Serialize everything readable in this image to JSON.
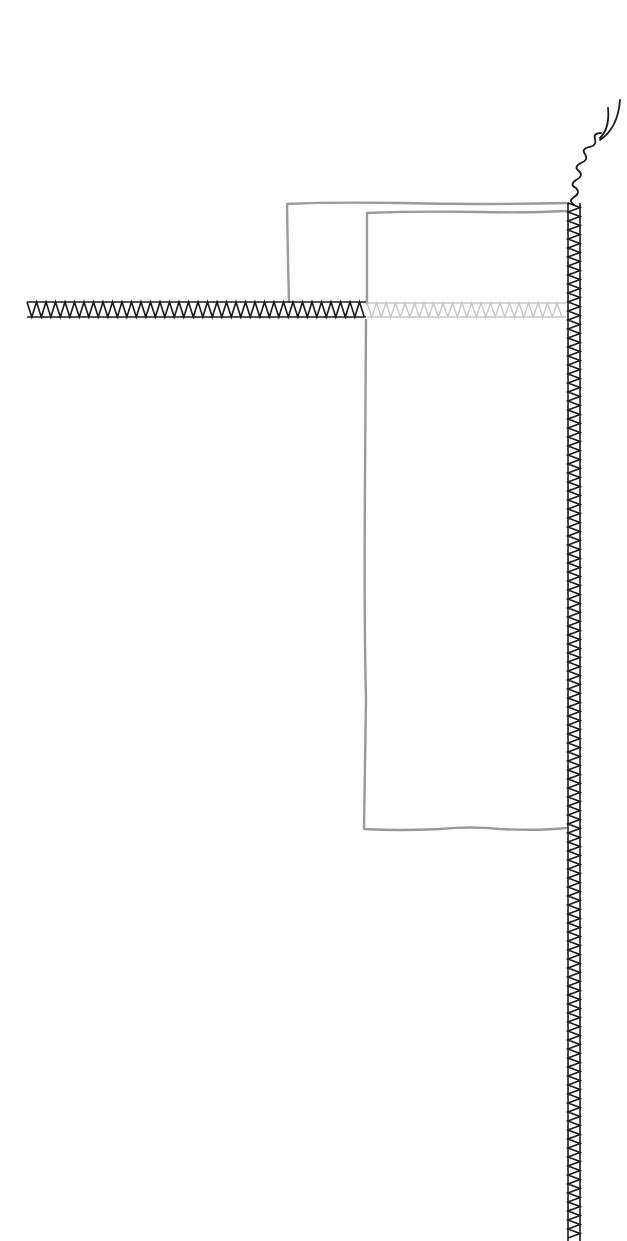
{
  "diagram": {
    "title": "",
    "colors": {
      "background": "#ffffff",
      "fabric_outline": "#9a9a9a",
      "stitch_dark": "#1a1a1a",
      "stitch_light": "#c8c8c8"
    },
    "elements": [
      {
        "name": "back-fabric-panel",
        "kind": "outline",
        "label": ""
      },
      {
        "name": "front-fabric-panel",
        "kind": "outline",
        "label": ""
      },
      {
        "name": "horizontal-zigzag-seam-visible",
        "kind": "zigzag-stitch",
        "style": "dark"
      },
      {
        "name": "horizontal-zigzag-seam-hidden",
        "kind": "zigzag-stitch",
        "style": "light"
      },
      {
        "name": "vertical-zigzag-seam",
        "kind": "zigzag-stitch",
        "style": "dark"
      },
      {
        "name": "thread-tails",
        "kind": "loose-thread"
      }
    ]
  }
}
